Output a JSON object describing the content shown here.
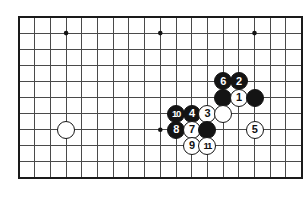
{
  "figure": {
    "kind": "go-board-diagram"
  },
  "board": {
    "colors": {
      "background": "#ffffff",
      "line": "#4a4a4a",
      "border": "#1a1a1a",
      "star_point": "#141414",
      "black_stone": "#141414",
      "white_stone": "#ffffff",
      "white_stone_border": "#161616",
      "black_label": "#ffffff",
      "white_label": "#111111"
    },
    "geometry": {
      "left": 19,
      "top": 17,
      "columns": 18,
      "rows": 11,
      "col_spacing": 15.7,
      "row_spacing": 16.1,
      "stone_diameter": 18,
      "border_width": 2.2,
      "line_width": 1
    },
    "star_points": [
      {
        "col": 3,
        "row": 1
      },
      {
        "col": 9,
        "row": 1
      },
      {
        "col": 15,
        "row": 1
      },
      {
        "col": 9,
        "row": 7
      }
    ],
    "stones": [
      {
        "col": 3,
        "row": 7,
        "color": "white",
        "label": "",
        "name": "stone-white-left"
      },
      {
        "col": 13,
        "row": 4,
        "color": "black",
        "label": "6",
        "name": "stone-black-6"
      },
      {
        "col": 14,
        "row": 4,
        "color": "black",
        "label": "2",
        "name": "stone-black-2"
      },
      {
        "col": 13,
        "row": 5,
        "color": "black",
        "label": "",
        "name": "stone-black-plain-a"
      },
      {
        "col": 14,
        "row": 5,
        "color": "white",
        "label": "1",
        "name": "stone-white-1"
      },
      {
        "col": 15,
        "row": 5,
        "color": "black",
        "label": "",
        "name": "stone-black-plain-b"
      },
      {
        "col": 10,
        "row": 6,
        "color": "black",
        "label": "10",
        "name": "stone-black-10"
      },
      {
        "col": 11,
        "row": 6,
        "color": "black",
        "label": "4",
        "name": "stone-black-4"
      },
      {
        "col": 12,
        "row": 6,
        "color": "white",
        "label": "3",
        "name": "stone-white-3"
      },
      {
        "col": 13,
        "row": 6,
        "color": "white",
        "label": "",
        "name": "stone-white-plain-a"
      },
      {
        "col": 10,
        "row": 7,
        "color": "black",
        "label": "8",
        "name": "stone-black-8"
      },
      {
        "col": 11,
        "row": 7,
        "color": "white",
        "label": "7",
        "name": "stone-white-7"
      },
      {
        "col": 12,
        "row": 7,
        "color": "black",
        "label": "",
        "name": "stone-black-plain-c"
      },
      {
        "col": 15,
        "row": 7,
        "color": "white",
        "label": "5",
        "name": "stone-white-5"
      },
      {
        "col": 11,
        "row": 8,
        "color": "white",
        "label": "9",
        "name": "stone-white-9"
      },
      {
        "col": 12,
        "row": 8,
        "color": "white",
        "label": "11",
        "name": "stone-white-11"
      }
    ]
  }
}
